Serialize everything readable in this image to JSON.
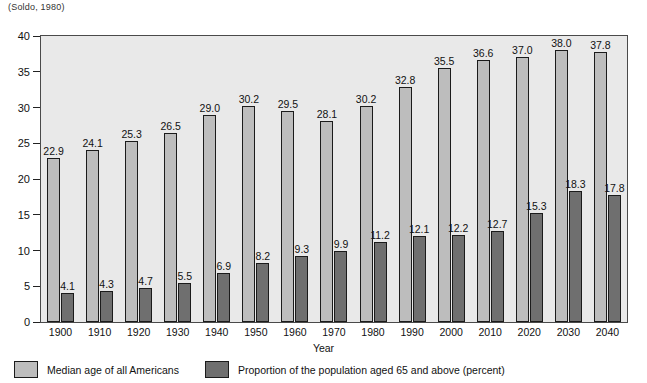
{
  "caption": "(Soldo, 1980)",
  "chart_data": {
    "type": "bar",
    "title": "",
    "subtitle": "",
    "xlabel": "Year",
    "ylabel": "",
    "ylim": [
      0,
      40
    ],
    "yticks": [
      0,
      5,
      10,
      15,
      20,
      25,
      30,
      35,
      40
    ],
    "ytick_labels": [
      "0",
      "5",
      "10",
      "15",
      "20",
      "25",
      "30",
      "35",
      "40"
    ],
    "grid": false,
    "legend_position": "bottom",
    "categories": [
      "1900",
      "1910",
      "1920",
      "1930",
      "1940",
      "1950",
      "1960",
      "1970",
      "1980",
      "1990",
      "2000",
      "2010",
      "2020",
      "2030",
      "2040"
    ],
    "series": [
      {
        "name": "Median age of all Americans",
        "color": "#bdbdbd",
        "values": [
          22.9,
          24.1,
          25.3,
          26.5,
          29.0,
          30.2,
          29.5,
          28.1,
          30.2,
          32.8,
          35.5,
          36.6,
          37.0,
          38.0,
          37.8
        ],
        "value_labels": [
          "22.9",
          "24.1",
          "25.3",
          "26.5",
          "29.0",
          "30.2",
          "29.5",
          "28.1",
          "30.2",
          "32.8",
          "35.5",
          "36.6",
          "37.0",
          "38.0",
          "37.8"
        ]
      },
      {
        "name": "Proportion of the population aged 65 and above (percent)",
        "color": "#6f6f6f",
        "values": [
          4.1,
          4.3,
          4.7,
          5.5,
          6.9,
          8.2,
          9.3,
          9.9,
          11.2,
          12.1,
          12.2,
          12.7,
          15.3,
          18.3,
          17.8
        ],
        "value_labels": [
          "4.1",
          "4.3",
          "4.7",
          "5.5",
          "6.9",
          "8.2",
          "9.3",
          "9.9",
          "11.2",
          "12.1",
          "12.2",
          "12.7",
          "15.3",
          "18.3",
          "17.8"
        ]
      }
    ]
  },
  "legend": {
    "items": [
      {
        "label": "Median age of all Americans",
        "color": "#bdbdbd"
      },
      {
        "label": "Proportion of the population aged 65 and above (percent)",
        "color": "#6f6f6f"
      }
    ]
  }
}
